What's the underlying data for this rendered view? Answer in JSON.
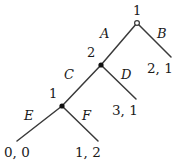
{
  "figure": {
    "type": "extensive-form-game-tree",
    "stroke_color": "#3a3a3a",
    "text_color": "#1a1a1a",
    "background": "#ffffff"
  },
  "nodes": [
    {
      "id": "root",
      "label": "1",
      "marker": "open-circle",
      "x": 137,
      "y": 23,
      "label_x": 133,
      "label_y": 4
    },
    {
      "id": "mid",
      "label": "2",
      "marker": "filled-circle",
      "x": 101,
      "y": 65,
      "label_x": 87,
      "label_y": 46
    },
    {
      "id": "lower",
      "label": "1",
      "marker": "filled-circle",
      "x": 62,
      "y": 106,
      "label_x": 49,
      "label_y": 87
    }
  ],
  "edges": [
    {
      "id": "A",
      "label": "A",
      "from": "root",
      "to": "mid",
      "x1": 137,
      "y1": 23,
      "x2": 101,
      "y2": 65,
      "label_x": 100,
      "label_y": 27
    },
    {
      "id": "B",
      "label": "B",
      "from": "root",
      "to": "payoff_b",
      "x1": 137,
      "y1": 23,
      "x2": 171,
      "y2": 57,
      "label_x": 157,
      "label_y": 27
    },
    {
      "id": "C",
      "label": "C",
      "from": "mid",
      "to": "lower",
      "x1": 101,
      "y1": 65,
      "x2": 62,
      "y2": 106,
      "label_x": 64,
      "label_y": 68
    },
    {
      "id": "D",
      "label": "D",
      "from": "mid",
      "to": "payoff_d",
      "x1": 101,
      "y1": 65,
      "x2": 136,
      "y2": 99,
      "label_x": 121,
      "label_y": 68
    },
    {
      "id": "E",
      "label": "E",
      "from": "lower",
      "to": "payoff_e",
      "x1": 62,
      "y1": 106,
      "x2": 17,
      "y2": 141,
      "label_x": 24,
      "label_y": 109
    },
    {
      "id": "F",
      "label": "F",
      "from": "lower",
      "to": "payoff_f",
      "x1": 62,
      "y1": 106,
      "x2": 98,
      "y2": 141,
      "label_x": 82,
      "label_y": 109
    }
  ],
  "payoffs": [
    {
      "id": "payoff_b",
      "label": "2, 1",
      "x": 147,
      "y": 62
    },
    {
      "id": "payoff_d",
      "label": "3, 1",
      "x": 112,
      "y": 104
    },
    {
      "id": "payoff_e",
      "label": "0, 0",
      "x": 4,
      "y": 146
    },
    {
      "id": "payoff_f",
      "label": "1, 2",
      "x": 75,
      "y": 146
    }
  ]
}
